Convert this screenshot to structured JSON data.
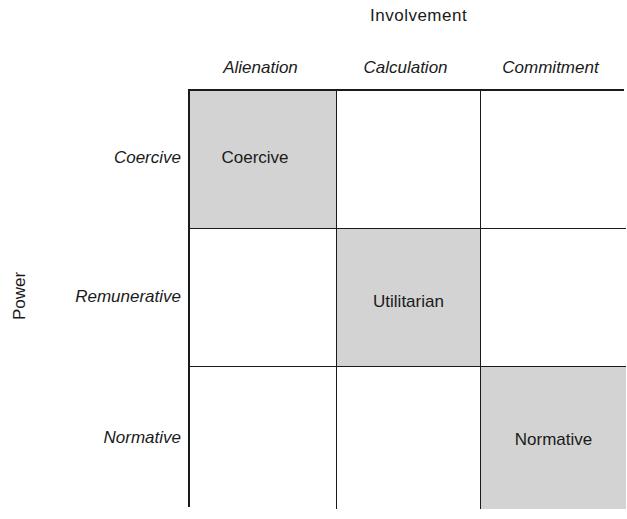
{
  "diagram": {
    "top_axis_title": "Involvement",
    "left_axis_title": "Power",
    "columns": [
      "Alienation",
      "Calculation",
      "Commitment"
    ],
    "rows": [
      "Coercive",
      "Remunerative",
      "Normative"
    ],
    "cells": [
      [
        "Coercive",
        "",
        ""
      ],
      [
        "",
        "Utilitarian",
        ""
      ],
      [
        "",
        "",
        "Normative"
      ]
    ],
    "shaded_cells": [
      [
        0,
        0
      ],
      [
        1,
        1
      ],
      [
        2,
        2
      ]
    ],
    "colors": {
      "shaded": "#d3d3d3",
      "line": "#1a1a1a",
      "background": "#ffffff"
    }
  }
}
